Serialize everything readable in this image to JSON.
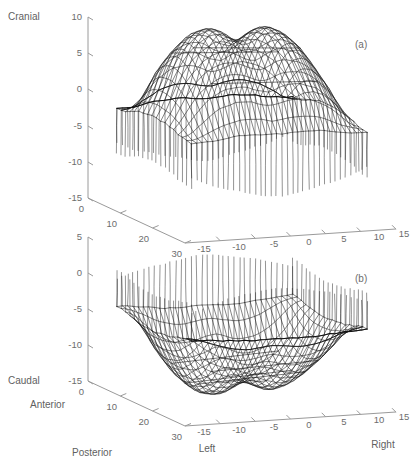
{
  "figure": {
    "background": "#ffffff",
    "line_color": "#111111",
    "axis_color": "#9a9a9a",
    "label_color": "#6d6d6d"
  },
  "panels": [
    {
      "id": "a",
      "label": "(a)",
      "vertical_axis": {
        "name": "Cranial",
        "ticks": [
          "10",
          "5",
          "0",
          "-5",
          "-10",
          "-15"
        ],
        "values": [
          10,
          5,
          0,
          -5,
          -10,
          -15
        ]
      },
      "depth_axis": {
        "name": "",
        "ticks": [
          "0",
          "10",
          "20",
          "30"
        ],
        "values": [
          0,
          10,
          20,
          30
        ]
      },
      "horizontal_axis": {
        "name_left": "",
        "name_right": "",
        "ticks": [
          "-15",
          "-10",
          "-5",
          "0",
          "5",
          "10",
          "15"
        ],
        "values": [
          -15,
          -10,
          -5,
          0,
          5,
          10,
          15
        ]
      }
    },
    {
      "id": "b",
      "label": "(b)",
      "vertical_axis": {
        "name": "Caudal",
        "ticks": [
          "5",
          "0",
          "-5",
          "-10",
          "-15"
        ],
        "values": [
          5,
          0,
          -5,
          -10,
          -15
        ]
      },
      "depth_axis": {
        "name_near": "Anterior",
        "name_far": "Posterior",
        "ticks": [
          "0",
          "10",
          "20",
          "30"
        ],
        "values": [
          0,
          10,
          20,
          30
        ]
      },
      "horizontal_axis": {
        "name_left": "Left",
        "name_right": "Right",
        "ticks": [
          "-15",
          "-10",
          "-5",
          "0",
          "5",
          "10",
          "15"
        ],
        "values": [
          -15,
          -10,
          -5,
          0,
          5,
          10,
          15
        ]
      }
    }
  ],
  "chart_data": {
    "type": "line",
    "title": "",
    "subtitle": "",
    "xlabel": "Left – Right (mm)",
    "ylabel": "Anterior – Posterior (mm)",
    "zlabel": "Cranial – Caudal (mm)",
    "xlim": [
      -15,
      15
    ],
    "ylim": [
      0,
      30
    ],
    "zlim_a": [
      -15,
      10
    ],
    "zlim_b": [
      -15,
      5
    ],
    "grid": false,
    "legend": null,
    "series": [
      {
        "name": "surface-a",
        "panel": "a",
        "mesh_rows": 22,
        "mesh_cols": 34,
        "note": "Dome-like surface with two lobes and a central saddle/notch; long vertical skirt lines descending from the rim."
      },
      {
        "name": "surface-b",
        "panel": "b",
        "mesh_rows": 20,
        "mesh_cols": 34,
        "note": "Inverted view showing a broad concave basin with a raised rim and a flattened plateau region crossed by straight chordal lines."
      }
    ]
  },
  "caption": {
    "text": ""
  }
}
